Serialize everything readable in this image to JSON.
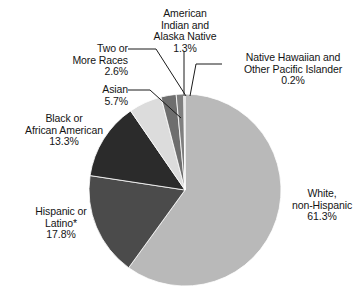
{
  "chart_data": {
    "type": "pie",
    "title": "",
    "subtitle": "",
    "xlabel": "",
    "ylabel": "",
    "legend_position": "none",
    "grid": false,
    "units": "percent",
    "start_angle_deg": 0,
    "direction": "clockwise",
    "categories": [
      "White, non-Hispanic",
      "Hispanic or Latino*",
      "Black or African American",
      "Asian",
      "Two or More Races",
      "American Indian and Alaska Native",
      "Native Hawaiian and Other Pacific Islander"
    ],
    "values": [
      61.3,
      17.8,
      13.3,
      5.7,
      2.6,
      1.3,
      0.2
    ],
    "slices": [
      {
        "key": "white",
        "label_lines": [
          "White,",
          "non-Hispanic",
          "61.3%"
        ],
        "name": "White, non-Hispanic",
        "value": 61.3,
        "value_text": "61.3%",
        "color": "#b9b9b9",
        "has_leader_line": false
      },
      {
        "key": "hispanic",
        "label_lines": [
          "Hispanic or",
          "Latino*",
          "17.8%"
        ],
        "name": "Hispanic or Latino*",
        "value": 17.8,
        "value_text": "17.8%",
        "color": "#4b4b4b",
        "has_leader_line": false
      },
      {
        "key": "black",
        "label_lines": [
          "Black or",
          "African American",
          "13.3%"
        ],
        "name": "Black or African American",
        "value": 13.3,
        "value_text": "13.3%",
        "color": "#2b2b2b",
        "has_leader_line": false
      },
      {
        "key": "asian",
        "label_lines": [
          "Asian",
          "5.7%"
        ],
        "name": "Asian",
        "value": 5.7,
        "value_text": "5.7%",
        "color": "#dcdcdc",
        "has_leader_line": true
      },
      {
        "key": "two-or-more",
        "label_lines": [
          "Two or",
          "More Races",
          "2.6%"
        ],
        "name": "Two or More Races",
        "value": 2.6,
        "value_text": "2.6%",
        "color": "#6e6e6e",
        "has_leader_line": true
      },
      {
        "key": "aian",
        "label_lines": [
          "American",
          "Indian and",
          "Alaska Native",
          "1.3%"
        ],
        "name": "American Indian and Alaska Native",
        "value": 1.3,
        "value_text": "1.3%",
        "color": "#7f7f7f",
        "has_leader_line": true
      },
      {
        "key": "nhpi",
        "label_lines": [
          "Native Hawaiian and",
          "Other Pacific Islander",
          "0.2%"
        ],
        "name": "Native Hawaiian and Other Pacific Islander",
        "value": 0.2,
        "value_text": "0.2%",
        "color": "#c9c9c9",
        "has_leader_line": true
      }
    ],
    "footnote": "*"
  },
  "labels": {
    "white": {
      "l1": "White,",
      "l2": "non-Hispanic",
      "l3": "61.3%"
    },
    "hispanic": {
      "l1": "Hispanic or",
      "l2": "Latino*",
      "l3": "17.8%"
    },
    "black": {
      "l1": "Black or",
      "l2": "African American",
      "l3": "13.3%"
    },
    "asian": {
      "l1": "Asian",
      "l2": "5.7%"
    },
    "two": {
      "l1": "Two or",
      "l2": "More Races",
      "l3": "2.6%"
    },
    "aian": {
      "l1": "American",
      "l2": "Indian and",
      "l3": "Alaska Native",
      "l4": "1.3%"
    },
    "nhpi": {
      "l1": "Native Hawaiian and",
      "l2": "Other Pacific Islander",
      "l3": "0.2%"
    }
  },
  "colors": {
    "background": "#ffffff",
    "text": "#141414",
    "leader_line": "#1a1a1a",
    "white_slice": "#b9b9b9",
    "hispanic_slice": "#4b4b4b",
    "black_slice": "#2b2b2b",
    "asian_slice": "#dcdcdc",
    "two_slice": "#6e6e6e",
    "aian_slice": "#7f7f7f",
    "nhpi_slice": "#c9c9c9"
  }
}
